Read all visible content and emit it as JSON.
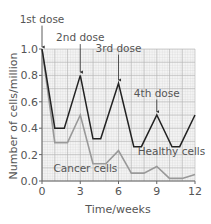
{
  "chart_data": {
    "type": "line",
    "title": "",
    "xlabel": "Time/weeks",
    "ylabel": "Number of cells/million",
    "xlim": [
      0,
      12
    ],
    "ylim": [
      0,
      1.0
    ],
    "x_ticks": [
      0,
      3,
      6,
      9,
      12
    ],
    "x_tick_labels": [
      "0",
      "3",
      "6",
      "9",
      "12"
    ],
    "y_ticks": [
      0,
      0.2,
      0.4,
      0.6,
      0.8,
      1.0
    ],
    "y_tick_labels": [
      "0.0",
      "0.2",
      "0.4",
      "0.6",
      "0.8",
      "1.0"
    ],
    "grid": true,
    "legend": "inline labels",
    "series": [
      {
        "name": "Healthy cells",
        "color": "#222222",
        "x": [
          0,
          1,
          1.75,
          3,
          4,
          4.6,
          6,
          7.2,
          7.8,
          9,
          10.2,
          10.8,
          12
        ],
        "values": [
          1.0,
          0.4,
          0.4,
          0.8,
          0.32,
          0.32,
          0.74,
          0.26,
          0.26,
          0.5,
          0.26,
          0.26,
          0.5
        ],
        "label_pos": [
          7.5,
          0.2
        ]
      },
      {
        "name": "Cancer cells",
        "color": "#999999",
        "x": [
          0,
          1,
          2,
          3,
          4,
          5,
          6,
          7,
          8,
          9,
          10,
          11,
          12
        ],
        "values": [
          1.0,
          0.29,
          0.29,
          0.5,
          0.13,
          0.13,
          0.23,
          0.06,
          0.06,
          0.11,
          0.02,
          0.02,
          0.05
        ],
        "label_pos": [
          0.9,
          0.07
        ]
      }
    ],
    "annotations": [
      {
        "text": "1st dose",
        "x": 0,
        "text_y": 1.2,
        "arrow_to": 1.0
      },
      {
        "text": "2nd dose",
        "x": 3,
        "text_y": 1.06,
        "arrow_to": 0.81
      },
      {
        "text": "3rd dose",
        "x": 6,
        "text_y": 0.98,
        "arrow_to": 0.75
      },
      {
        "text": "4th dose",
        "x": 9,
        "text_y": 0.64,
        "arrow_to": 0.51
      }
    ]
  }
}
